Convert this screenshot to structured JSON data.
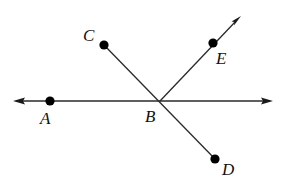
{
  "diagram": {
    "title": "",
    "type": "geometry-lines-and-rays",
    "points": [
      {
        "id": "A",
        "label": "A"
      },
      {
        "id": "B",
        "label": "B"
      },
      {
        "id": "C",
        "label": "C"
      },
      {
        "id": "D",
        "label": "D"
      },
      {
        "id": "E",
        "label": "E"
      }
    ],
    "objects": [
      {
        "kind": "line",
        "through": [
          "A",
          "B"
        ],
        "arrows": "both"
      },
      {
        "kind": "segment",
        "endpoints": [
          "C",
          "D"
        ],
        "through": "B"
      },
      {
        "kind": "ray",
        "from": "B",
        "through": "E",
        "arrows": "end"
      }
    ],
    "labels": {
      "A": "A",
      "B": "B",
      "C": "C",
      "D": "D",
      "E": "E"
    }
  }
}
